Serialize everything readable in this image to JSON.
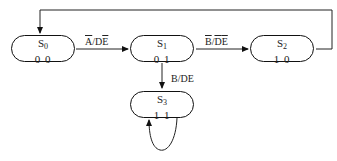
{
  "diagram": {
    "type": "state-machine",
    "states": [
      {
        "id": "S0",
        "name": "S",
        "sub": "0",
        "code": "0 0"
      },
      {
        "id": "S1",
        "name": "S",
        "sub": "1",
        "code": "0 1"
      },
      {
        "id": "S2",
        "name": "S",
        "sub": "2",
        "code": "1 0"
      },
      {
        "id": "S3",
        "name": "S",
        "sub": "3",
        "code": "1 1"
      }
    ],
    "transitions": [
      {
        "from": "S0",
        "to": "S1",
        "label": "Ā/DĒ",
        "parts": {
          "a": "A",
          "slash": "/D",
          "e": "E"
        }
      },
      {
        "from": "S1",
        "to": "S2",
        "label": "B̄/D̄Ē",
        "parts": {
          "b": "B",
          "slash": "/",
          "d": "D",
          "e": "E"
        }
      },
      {
        "from": "S1",
        "to": "S3",
        "label": "B/DE"
      },
      {
        "from": "S2",
        "to": "S0",
        "label": ""
      },
      {
        "from": "S3",
        "to": "S3",
        "label": ""
      }
    ]
  }
}
